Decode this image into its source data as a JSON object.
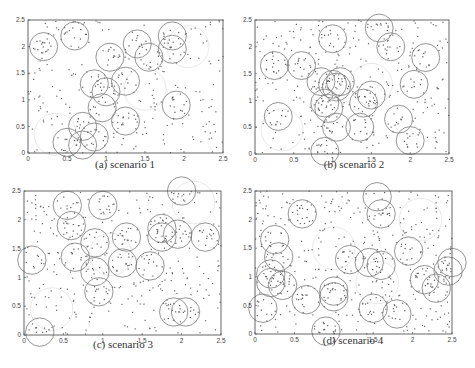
{
  "figure": {
    "panels": [
      {
        "id": "a",
        "caption": "(a) scenario 1",
        "frame": {
          "x0": 28,
          "y0": 20,
          "x1": 223,
          "y1": 153
        },
        "caption_pos": {
          "x": 125,
          "y": 164
        }
      },
      {
        "id": "b",
        "caption": "(b) scenario 2",
        "frame": {
          "x0": 255,
          "y0": 20,
          "x1": 449,
          "y1": 154
        },
        "caption_pos": {
          "x": 354,
          "y": 164
        }
      },
      {
        "id": "c",
        "caption": "(c) scenario 3",
        "frame": {
          "x0": 24,
          "y0": 191,
          "x1": 221,
          "y1": 335
        },
        "caption_pos": {
          "x": 123,
          "y": 344
        }
      },
      {
        "id": "d",
        "caption": "(d) scenario 4",
        "frame": {
          "x0": 255,
          "y0": 191,
          "x1": 452,
          "y1": 334
        },
        "caption_pos": {
          "x": 353,
          "y": 340
        }
      }
    ]
  },
  "chart_data": [
    {
      "type": "scatter",
      "title": "(a) scenario 1",
      "xlim": [
        0,
        2.5
      ],
      "ylim": [
        0,
        2.5
      ],
      "xticks": [
        "0",
        "0.5",
        "1",
        "1.5",
        "2",
        "2.5"
      ],
      "yticks": [
        "0",
        "0.5",
        "1",
        "1.5",
        "2",
        "2.5"
      ],
      "grid": false,
      "circle_radius": 0.18,
      "circles": [
        [
          0.2,
          2.0
        ],
        [
          0.6,
          2.2
        ],
        [
          1.05,
          1.8
        ],
        [
          1.4,
          2.05
        ],
        [
          1.55,
          1.8
        ],
        [
          1.85,
          2.2
        ],
        [
          1.85,
          1.95
        ],
        [
          0.85,
          1.3
        ],
        [
          1.0,
          1.15
        ],
        [
          1.25,
          1.35
        ],
        [
          0.95,
          0.85
        ],
        [
          1.25,
          0.6
        ],
        [
          0.7,
          0.5
        ],
        [
          0.85,
          0.3
        ],
        [
          0.5,
          0.2
        ],
        [
          0.7,
          0.15
        ],
        [
          1.9,
          0.9
        ]
      ],
      "faint_circles": [
        [
          2.05,
          2.0
        ],
        [
          1.5,
          1.2
        ],
        [
          0.35,
          0.35
        ]
      ],
      "points_count": 250
    },
    {
      "type": "scatter",
      "title": "(b) scenario 2",
      "xlim": [
        0,
        2.5
      ],
      "ylim": [
        0,
        2.5
      ],
      "xticks": [
        "0",
        "0.5",
        "1",
        "1.5",
        "2",
        "2.5"
      ],
      "yticks": [
        "0",
        "0.5",
        "1",
        "1.5",
        "2",
        "2.5"
      ],
      "grid": false,
      "circle_radius": 0.18,
      "circles": [
        [
          0.25,
          1.65
        ],
        [
          0.6,
          1.65
        ],
        [
          1.0,
          2.15
        ],
        [
          1.6,
          2.35
        ],
        [
          1.75,
          2.0
        ],
        [
          2.2,
          1.8
        ],
        [
          0.85,
          1.35
        ],
        [
          1.0,
          1.3
        ],
        [
          1.1,
          1.35
        ],
        [
          1.05,
          1.25
        ],
        [
          2.05,
          1.3
        ],
        [
          1.5,
          1.1
        ],
        [
          1.4,
          0.95
        ],
        [
          0.9,
          0.95
        ],
        [
          0.95,
          0.85
        ],
        [
          0.3,
          0.7
        ],
        [
          1.05,
          0.5
        ],
        [
          1.35,
          0.5
        ],
        [
          1.85,
          0.65
        ],
        [
          2.0,
          0.25
        ],
        [
          0.9,
          0.05
        ]
      ],
      "faint_circles": [
        [
          1.5,
          1.3
        ],
        [
          0.35,
          0.45
        ]
      ],
      "points_count": 300
    },
    {
      "type": "scatter",
      "title": "(c) scenario 3",
      "xlim": [
        0,
        2.5
      ],
      "ylim": [
        0,
        2.5
      ],
      "xticks": [
        "0",
        "0.5",
        "1",
        "1.5",
        "2",
        "2.5"
      ],
      "yticks": [
        "0",
        "0.5",
        "1",
        "1.5",
        "2",
        "2.5"
      ],
      "grid": false,
      "circle_radius": 0.18,
      "circles": [
        [
          0.55,
          2.25
        ],
        [
          1.0,
          2.25
        ],
        [
          2.0,
          2.5
        ],
        [
          0.6,
          1.9
        ],
        [
          1.75,
          1.85
        ],
        [
          1.95,
          1.75
        ],
        [
          1.75,
          1.7
        ],
        [
          2.3,
          1.7
        ],
        [
          0.9,
          1.6
        ],
        [
          1.3,
          1.7
        ],
        [
          0.65,
          1.35
        ],
        [
          0.1,
          1.3
        ],
        [
          1.25,
          1.25
        ],
        [
          0.9,
          1.1
        ],
        [
          1.6,
          1.2
        ],
        [
          0.95,
          0.75
        ],
        [
          1.9,
          0.4
        ],
        [
          2.05,
          0.4
        ],
        [
          0.2,
          0.05
        ]
      ],
      "faint_circles": [
        [
          0.35,
          0.45
        ],
        [
          1.1,
          1.4
        ],
        [
          2.15,
          2.3
        ]
      ],
      "points_count": 320
    },
    {
      "type": "scatter",
      "title": "(d) scenario 4",
      "xlim": [
        0,
        2.5
      ],
      "ylim": [
        0,
        2.5
      ],
      "xticks": [
        "0",
        "0.5",
        "1",
        "1.5",
        "2",
        "2.5"
      ],
      "yticks": [
        "0",
        "0.5",
        "1",
        "1.5",
        "2",
        "2.5"
      ],
      "grid": false,
      "circle_radius": 0.18,
      "circles": [
        [
          1.55,
          2.4
        ],
        [
          1.6,
          2.1
        ],
        [
          0.6,
          2.1
        ],
        [
          0.25,
          1.65
        ],
        [
          0.3,
          1.35
        ],
        [
          0.2,
          1.05
        ],
        [
          0.2,
          0.9
        ],
        [
          0.35,
          0.85
        ],
        [
          0.1,
          0.45
        ],
        [
          0.65,
          0.6
        ],
        [
          0.9,
          0.05
        ],
        [
          1.0,
          0.75
        ],
        [
          1.0,
          0.65
        ],
        [
          1.2,
          1.3
        ],
        [
          1.45,
          1.25
        ],
        [
          1.6,
          1.2
        ],
        [
          1.95,
          1.45
        ],
        [
          1.5,
          0.45
        ],
        [
          1.8,
          0.35
        ],
        [
          2.15,
          0.95
        ],
        [
          2.3,
          0.8
        ],
        [
          2.45,
          1.1
        ],
        [
          2.5,
          1.25
        ]
      ],
      "faint_circles": [
        [
          1.0,
          1.5
        ],
        [
          1.55,
          0.9
        ],
        [
          2.1,
          2.0
        ]
      ],
      "points_count": 380
    }
  ]
}
